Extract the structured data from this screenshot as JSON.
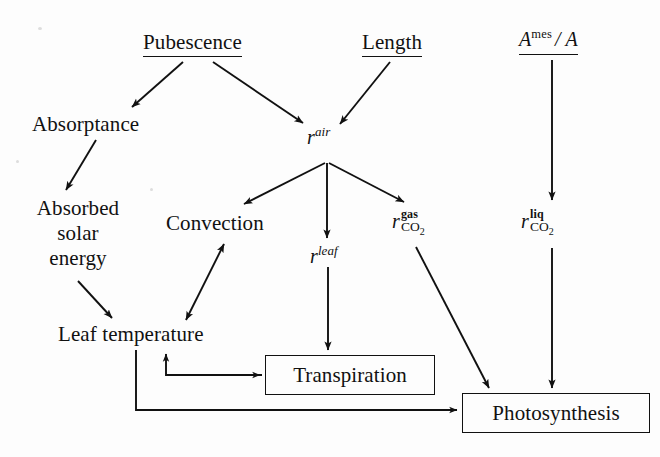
{
  "diagram": {
    "background_color": "#fdfdfd",
    "ink_color": "#111111",
    "width": 660,
    "height": 457,
    "nodes": [
      {
        "id": "pubescence",
        "label": "Pubescence",
        "style": "underlined-heading",
        "x": 143,
        "y": 30,
        "w": 112,
        "h": 26
      },
      {
        "id": "length",
        "label": "Length",
        "style": "underlined-heading",
        "x": 362,
        "y": 30,
        "w": 72,
        "h": 26
      },
      {
        "id": "a_mes_a",
        "label": "A^mes / A",
        "label_base": "A",
        "label_sup": "mes",
        "label_tail": "/ A",
        "style": "underlined-heading-math",
        "x": 520,
        "y": 26,
        "w": 80,
        "h": 28
      },
      {
        "id": "absorptance",
        "label": "Absorptance",
        "style": "plain",
        "x": 32,
        "y": 112,
        "w": 124,
        "h": 26
      },
      {
        "id": "r_air",
        "label": "r^air",
        "label_base": "r",
        "label_sup": "air",
        "style": "math",
        "x": 308,
        "y": 124,
        "w": 40,
        "h": 24
      },
      {
        "id": "absorbed_solar_energy",
        "label": "Absorbed solar energy",
        "lines": [
          "Absorbed",
          "solar",
          "energy"
        ],
        "style": "stacked",
        "x": 26,
        "y": 196,
        "w": 104,
        "h": 80
      },
      {
        "id": "convection",
        "label": "Convection",
        "style": "plain",
        "x": 166,
        "y": 211,
        "w": 118,
        "h": 26
      },
      {
        "id": "r_leaf",
        "label": "r^leaf",
        "label_base": "r",
        "label_sup": "leaf",
        "style": "math",
        "x": 310,
        "y": 242,
        "w": 42,
        "h": 24
      },
      {
        "id": "r_gas_co2",
        "label": "r^gas_CO2",
        "label_base": "r",
        "label_sup": "gas",
        "label_sub": "CO2",
        "style": "math-supsub",
        "x": 395,
        "y": 208,
        "w": 58,
        "h": 36
      },
      {
        "id": "r_liq_co2",
        "label": "r^liq_CO2",
        "label_base": "r",
        "label_sup": "liq",
        "label_sub": "CO2",
        "style": "math-supsub",
        "x": 523,
        "y": 208,
        "w": 58,
        "h": 36
      },
      {
        "id": "leaf_temperature",
        "label": "Leaf temperature",
        "style": "plain",
        "x": 58,
        "y": 322,
        "w": 170,
        "h": 26
      },
      {
        "id": "transpiration",
        "label": "Transpiration",
        "style": "box",
        "x": 265,
        "y": 355,
        "w": 168,
        "h": 38
      },
      {
        "id": "photosynthesis",
        "label": "Photosynthesis",
        "style": "box",
        "x": 462,
        "y": 393,
        "w": 186,
        "h": 38
      }
    ],
    "edges": [
      {
        "id": "e1",
        "from": "pubescence",
        "to": "absorptance",
        "arrow": "single"
      },
      {
        "id": "e2",
        "from": "pubescence",
        "to": "r_air",
        "arrow": "single"
      },
      {
        "id": "e3",
        "from": "length",
        "to": "r_air",
        "arrow": "single"
      },
      {
        "id": "e4",
        "from": "a_mes_a",
        "to": "r_liq_co2",
        "arrow": "single"
      },
      {
        "id": "e5",
        "from": "absorptance",
        "to": "absorbed_solar_energy",
        "arrow": "single"
      },
      {
        "id": "e6",
        "from": "r_air",
        "to": "convection",
        "arrow": "single"
      },
      {
        "id": "e7",
        "from": "r_air",
        "to": "r_leaf",
        "arrow": "single"
      },
      {
        "id": "e8",
        "from": "r_air",
        "to": "r_gas_co2",
        "arrow": "single"
      },
      {
        "id": "e9",
        "from": "absorbed_solar_energy",
        "to": "leaf_temperature",
        "arrow": "single"
      },
      {
        "id": "e10",
        "from": "convection",
        "to": "leaf_temperature",
        "arrow": "double"
      },
      {
        "id": "e11",
        "from": "r_leaf",
        "to": "transpiration",
        "arrow": "single"
      },
      {
        "id": "e12",
        "from": "r_gas_co2",
        "to": "photosynthesis",
        "arrow": "single"
      },
      {
        "id": "e13",
        "from": "r_liq_co2",
        "to": "photosynthesis",
        "arrow": "single"
      },
      {
        "id": "e14",
        "from": "leaf_temperature",
        "to": "transpiration",
        "arrow": "single",
        "routing": "orthogonal"
      },
      {
        "id": "e15",
        "from": "transpiration",
        "to": "leaf_temperature",
        "arrow": "single",
        "routing": "orthogonal-feedback"
      },
      {
        "id": "e16",
        "from": "leaf_temperature",
        "to": "photosynthesis",
        "arrow": "single",
        "routing": "orthogonal"
      }
    ]
  }
}
